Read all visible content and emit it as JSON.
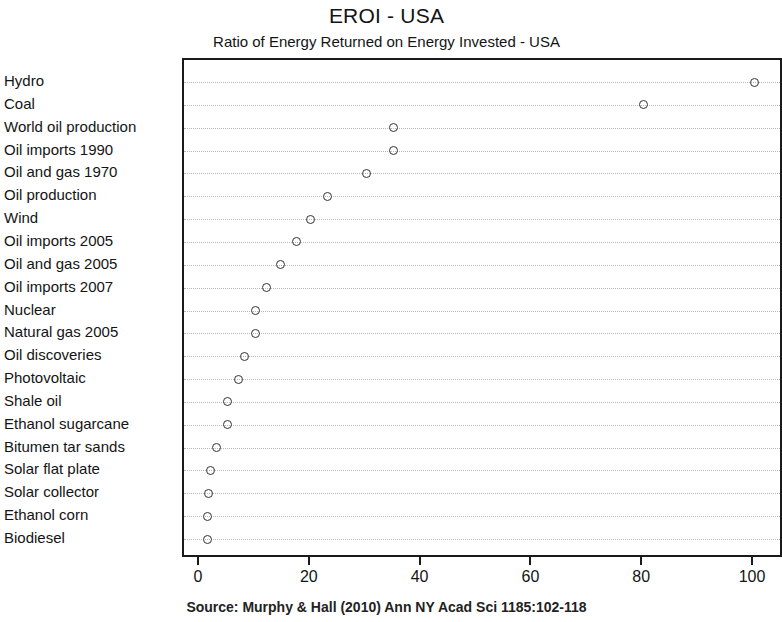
{
  "chart_data": {
    "type": "scatter",
    "title": "EROI - USA",
    "subtitle": "Ratio of Energy Returned on Energy Invested - USA",
    "xlabel": "",
    "ylabel": "",
    "xlim": [
      0,
      100
    ],
    "xticks": [
      0,
      20,
      40,
      60,
      80,
      100
    ],
    "xtick_labels": [
      "0",
      "20",
      "40",
      "60",
      "80",
      "100"
    ],
    "grid": true,
    "grid_axis": "y",
    "legend": false,
    "orientation": "horizontal",
    "marker": "open-circle",
    "categories": [
      "Hydro",
      "Coal",
      "World oil production",
      "Oil imports 1990",
      "Oil and gas 1970",
      "Oil production",
      "Wind",
      "Oil imports 2005",
      "Oil and gas 2005",
      "Oil imports 2007",
      "Nuclear",
      "Natural gas 2005",
      "Oil discoveries",
      "Photovoltaic",
      "Shale oil",
      "Ethanol sugarcane",
      "Bitumen tar sands",
      "Solar flat plate",
      "Solar collector",
      "Ethanol corn",
      "Biodiesel"
    ],
    "values": [
      100,
      80,
      35,
      35,
      30,
      23,
      20,
      17.5,
      14.5,
      12,
      10,
      10,
      8,
      7,
      5,
      5,
      3,
      1.9,
      1.6,
      1.3,
      1.3
    ],
    "source": "Source: Murphy & Hall (2010) Ann NY Acad Sci 1185:102-118",
    "colors": {
      "marker_stroke": "#333333",
      "axis": "#1a1a1a",
      "grid": "#b8b8b8",
      "text": "#141414",
      "background": "#ffffff"
    }
  }
}
